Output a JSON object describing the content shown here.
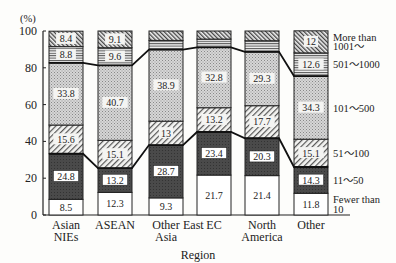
{
  "chart_data": {
    "type": "bar",
    "stacked": true,
    "title": "",
    "xlabel": "Region",
    "ylabel": "(%)",
    "ylim": [
      0,
      100
    ],
    "yticks": [
      0,
      20,
      40,
      60,
      80,
      100
    ],
    "grid": false,
    "legend_position": "right (labels beside last bar)",
    "categories": [
      [
        "Asian",
        "NIEs"
      ],
      [
        "ASEAN"
      ],
      [
        "Other",
        "Asia"
      ],
      [
        "EC"
      ],
      [
        "North",
        "America"
      ],
      [
        "Other"
      ]
    ],
    "category_names": [
      "Asian NIEs",
      "ASEAN",
      "Other East Asia",
      "EC",
      "North America",
      "Other"
    ],
    "extra_x_label": {
      "text": "East",
      "between": [
        2,
        3
      ]
    },
    "series": [
      {
        "name": "Fewer than 10",
        "legend": [
          "Fewer than",
          "10"
        ],
        "pattern": "white",
        "values": [
          8.5,
          12.3,
          9.3,
          21.7,
          21.4,
          11.8
        ],
        "labels": [
          "8.5",
          "12.3",
          "9.3",
          "21.7",
          "21.4",
          "11.8"
        ]
      },
      {
        "name": "11~50",
        "legend": [
          "11～50"
        ],
        "pattern": "dark",
        "values": [
          24.8,
          13.2,
          28.7,
          23.4,
          20.3,
          14.3
        ],
        "labels": [
          "24.8",
          "13.2",
          "28.7",
          "23.4",
          "20.3",
          "14.3"
        ]
      },
      {
        "name": "51~100",
        "legend": [
          "51～100"
        ],
        "pattern": "diag",
        "values": [
          15.6,
          15.1,
          13,
          13.2,
          17.7,
          15.1
        ],
        "labels": [
          "15.6",
          "15.1",
          "13",
          "13.2",
          "17.7",
          "15.1"
        ]
      },
      {
        "name": "101~500",
        "legend": [
          "101～500"
        ],
        "pattern": "dots",
        "values": [
          33.8,
          40.7,
          38.9,
          32.8,
          29.3,
          34.3
        ],
        "labels": [
          "33.8",
          "40.7",
          "38.9",
          "32.8",
          "29.3",
          "34.3"
        ]
      },
      {
        "name": "501~1000",
        "legend": [
          "501～1000"
        ],
        "pattern": "hlines",
        "values": [
          8.8,
          9.6,
          5.0,
          4.5,
          6.0,
          12.6
        ],
        "labels": [
          "8.8",
          "9.6",
          "",
          "",
          "",
          "12.6"
        ]
      },
      {
        "name": "More than 1001~",
        "legend": [
          "More than",
          "1001～"
        ],
        "pattern": "backdiag",
        "values": [
          8.4,
          9.1,
          5.1,
          4.4,
          5.3,
          12.0
        ],
        "labels": [
          "8.4",
          "9.1",
          "",
          "",
          "",
          "12"
        ]
      }
    ],
    "connector_lines": [
      {
        "between_series": [
          1,
          2
        ],
        "description": "line joining tops of 11~50 segments"
      },
      {
        "between_series": [
          3,
          4
        ],
        "description": "line joining tops of 101~500 segments"
      }
    ]
  }
}
